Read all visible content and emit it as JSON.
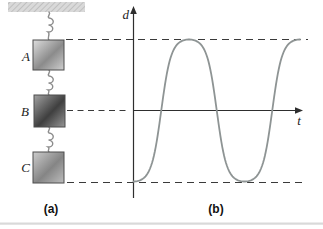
{
  "figure": {
    "panel_a": {
      "label": "(a)",
      "description": "Three blocks hanging vertically from a ceiling, connected in series by springs",
      "ceiling": "hatched ceiling mount",
      "blocks": [
        {
          "label": "A",
          "shade": "light gray",
          "aligned_guide": "maximum d (top dashed line)"
        },
        {
          "label": "B",
          "shade": "dark gray",
          "aligned_guide": "zero d (t-axis level dashed line)"
        },
        {
          "label": "C",
          "shade": "medium gray",
          "aligned_guide": "minimum d (bottom dashed line)"
        }
      ]
    },
    "panel_b": {
      "label": "(b)",
      "description": "Graph of displacement d versus time t for the oscillation"
    }
  },
  "chart_data": {
    "type": "line",
    "title": "",
    "xlabel": "t",
    "ylabel": "d",
    "x_range": [
      0,
      1.5
    ],
    "x_unit": "periods (axes have no numeric ticks)",
    "ylim": [
      -1,
      1
    ],
    "waveform": "flattened negative cosine: d(t) = -cos(2πt) with flattened extremes, starting at minimum",
    "flatten_k": 1.7,
    "series": [
      {
        "name": "displacement",
        "keypoints": [
          {
            "t": 0.0,
            "d": -1
          },
          {
            "t": 0.25,
            "d": 0
          },
          {
            "t": 0.5,
            "d": 1
          },
          {
            "t": 0.75,
            "d": 0
          },
          {
            "t": 1.0,
            "d": -1
          },
          {
            "t": 1.25,
            "d": 0
          },
          {
            "t": 1.5,
            "d": 1
          }
        ]
      }
    ],
    "guides": [
      {
        "d": 1,
        "style": "dashed",
        "aligns_with": "top edge of block A"
      },
      {
        "d": 0,
        "style": "dashed left of axis, solid t-axis",
        "aligns_with": "middle of block B"
      },
      {
        "d": -1,
        "style": "dashed",
        "aligns_with": "bottom edge of block C"
      }
    ],
    "grid": false,
    "legend": false
  },
  "colors": {
    "axis": "#2e2e2e",
    "dashed_guide": "#3a3a3a",
    "curve": "#8e9494",
    "spring": "#8c8c8c",
    "ceiling_fill": "#d9d9d9",
    "ceiling_hatch": "#aaaaaa",
    "block_border": "#4d4d4d",
    "page_rule": "#d9d9d9"
  }
}
